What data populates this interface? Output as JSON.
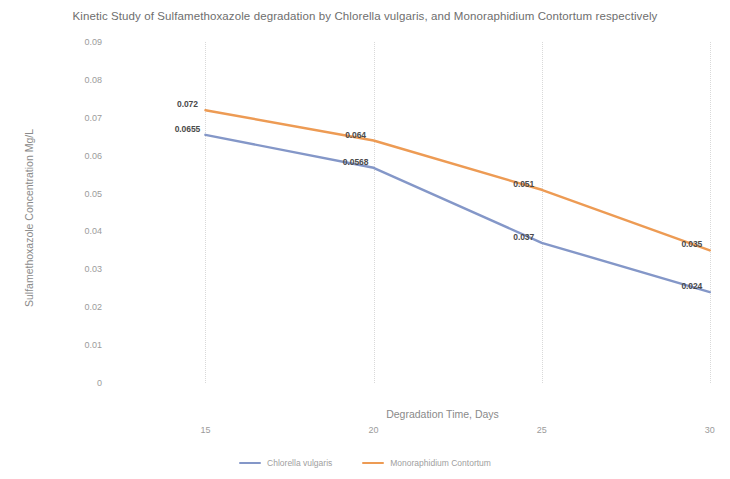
{
  "chart_data": {
    "type": "line",
    "title": "Kinetic Study of Sulfamethoxazole degradation by Chlorella vulgaris, and Monoraphidium Contortum respectively",
    "xlabel": "Degradation Time, Days",
    "ylabel": "Sulfamethoxazole Concentration Mg/L",
    "x": [
      15,
      20,
      25,
      30
    ],
    "xticklabels": [
      "15",
      "20",
      "25",
      "30"
    ],
    "xlim": [
      13.5,
      30.6
    ],
    "ylim": [
      0,
      0.09
    ],
    "yticks": [
      0.09,
      0.08,
      0.07,
      0.06,
      0.05,
      0.04,
      0.03,
      0.02,
      0.01,
      0
    ],
    "yticklabels": [
      "0.09",
      "0.08",
      "0.07",
      "0.06",
      "0.05",
      "0.04",
      "0.03",
      "0.02",
      "0.01",
      "0"
    ],
    "grid": "vertical-dotted",
    "legend_position": "bottom-center",
    "series": [
      {
        "name": "Chlorella vulgaris",
        "color": "#8497c8",
        "values": [
          0.0655,
          0.0568,
          0.037,
          0.024
        ],
        "labels": [
          "0.0655",
          "0.0568",
          "0.037",
          "0.024"
        ]
      },
      {
        "name": "Monoraphidium Contortum",
        "color": "#ed9b54",
        "values": [
          0.072,
          0.064,
          0.051,
          0.035
        ],
        "labels": [
          "0.072",
          "0.064",
          "0.051",
          "0.035"
        ]
      }
    ]
  }
}
